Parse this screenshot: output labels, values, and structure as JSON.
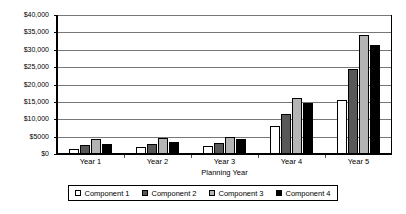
{
  "chart_data": {
    "type": "bar",
    "title": "",
    "xlabel": "Planning Year",
    "ylabel": "",
    "categories": [
      "Year 1",
      "Year 2",
      "Year 3",
      "Year 4",
      "Year 5"
    ],
    "ylim": [
      0,
      40000
    ],
    "ytick_labels": [
      "$0",
      "$5000",
      "$10,000",
      "$15,000",
      "$20,000",
      "$25,000",
      "$30,000",
      "$35,000",
      "$40,000"
    ],
    "ytick_values": [
      0,
      5000,
      10000,
      15000,
      20000,
      25000,
      30000,
      35000,
      40000
    ],
    "grid": true,
    "legend_position": "bottom",
    "series": [
      {
        "name": "Component 1",
        "color": "#ffffff",
        "values": [
          1500,
          2000,
          2400,
          8000,
          15500
        ]
      },
      {
        "name": "Component 2",
        "color": "#585858",
        "values": [
          2500,
          3000,
          3300,
          11500,
          24500
        ]
      },
      {
        "name": "Component 3",
        "color": "#b4b4b4",
        "values": [
          4200,
          4600,
          5000,
          16200,
          34200
        ]
      },
      {
        "name": "Component 4",
        "color": "#000000",
        "values": [
          3000,
          3600,
          4200,
          14600,
          31500
        ]
      }
    ]
  }
}
